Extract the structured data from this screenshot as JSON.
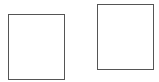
{
  "shapes": [
    {
      "name": "left-rectangle",
      "x": 8,
      "y": 14,
      "width": 57,
      "height": 66,
      "stroke": "#555555",
      "fill": "#ffffff"
    },
    {
      "name": "right-rectangle",
      "x": 97,
      "y": 4,
      "width": 57,
      "height": 66,
      "stroke": "#555555",
      "fill": "#ffffff"
    }
  ]
}
